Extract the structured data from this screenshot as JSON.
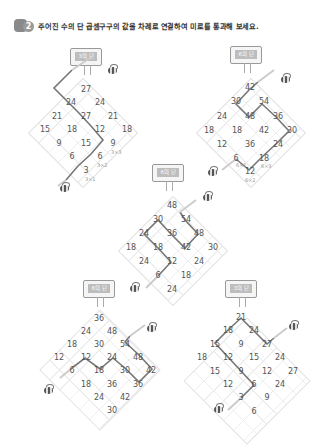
{
  "header": {
    "question_number": "2",
    "title": "주어진 수의 단 곱셈구구의 값을 차례로 연결하여 미로를 통과해 보세요."
  },
  "puzzles": [
    {
      "id": "p1",
      "sign": "3의 단",
      "rows": [
        [
          "27"
        ],
        [
          "24",
          "24"
        ],
        [
          "21",
          "27",
          "21"
        ],
        [
          "15",
          "18",
          "12",
          "18"
        ],
        [
          "9",
          "15",
          "9"
        ],
        [
          "6",
          "6"
        ],
        [
          "3"
        ]
      ],
      "notes": [
        "3×1",
        "3×2",
        "3×3"
      ],
      "path": [
        "3",
        "6",
        "9",
        "12",
        "15",
        "18",
        "21",
        "24",
        "27"
      ]
    },
    {
      "id": "p2",
      "sign": "6의 단",
      "rows": [
        [
          "42"
        ],
        [
          "30",
          "54"
        ],
        [
          "24",
          "48",
          "36"
        ],
        [
          "18",
          "18",
          "42",
          "30"
        ],
        [
          "12",
          "36",
          "24"
        ],
        [
          "6",
          "18"
        ],
        [
          "12"
        ]
      ],
      "notes": [
        "6×1",
        "6×2",
        "6×3"
      ],
      "path": [
        "6",
        "12",
        "18",
        "24",
        "30",
        "36",
        "42",
        "48",
        "54"
      ]
    },
    {
      "id": "p3",
      "sign": "6의 단",
      "rows": [
        [
          "48"
        ],
        [
          "30",
          "54"
        ],
        [
          "24",
          "36",
          "48"
        ],
        [
          "18",
          "18",
          "42",
          "30"
        ],
        [
          "24",
          "12",
          "24"
        ],
        [
          "6",
          "18"
        ],
        [
          "24"
        ]
      ],
      "notes": [],
      "path": [
        "6",
        "12",
        "18",
        "24",
        "30",
        "36",
        "42",
        "48",
        "54"
      ]
    },
    {
      "id": "p4",
      "sign": "6의 단",
      "rows": [
        [
          "36"
        ],
        [
          "24",
          "48"
        ],
        [
          "18",
          "30",
          "54"
        ],
        [
          "12",
          "12",
          "24",
          "48"
        ],
        [
          "6",
          "18",
          "30",
          "42"
        ],
        [
          "18",
          "36",
          "36"
        ],
        [
          "24",
          "42"
        ],
        [
          "30"
        ]
      ],
      "notes": [],
      "path": [
        "6",
        "12",
        "18",
        "24",
        "30",
        "36",
        "42",
        "48",
        "54"
      ]
    },
    {
      "id": "p5",
      "sign": "3의 단",
      "rows": [
        [
          "21"
        ],
        [
          "18",
          "24"
        ],
        [
          "15",
          "9",
          "27"
        ],
        [
          "18",
          "12",
          "15",
          "24"
        ],
        [
          "15",
          "9",
          "12",
          "27"
        ],
        [
          "12",
          "6",
          "24"
        ],
        [
          "3",
          "9"
        ],
        [
          "6"
        ]
      ],
      "notes": [],
      "path": [
        "3",
        "6",
        "9",
        "12",
        "15",
        "18",
        "21",
        "24",
        "27"
      ]
    }
  ]
}
